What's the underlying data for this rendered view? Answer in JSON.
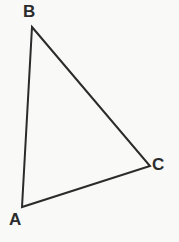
{
  "figure": {
    "kind": "geometry-diagram",
    "shape": "triangle",
    "background_color": "#f9f9f8",
    "stroke_color": "#2b2b2b",
    "stroke_width": 2,
    "label_color": "#2b2b2b"
  },
  "labels": {
    "a": "A",
    "b": "B",
    "c": "C"
  },
  "chart_data": {
    "type": "scatter",
    "title": "",
    "subtitle": "",
    "xlabel": "",
    "ylabel": "",
    "grid": false,
    "legend": "none",
    "xlim": [
      0,
      179
    ],
    "ylim": [
      242,
      0
    ],
    "annotations": [
      "A",
      "B",
      "C"
    ],
    "points": [
      {
        "label": "A",
        "x": 22,
        "y": 207
      },
      {
        "label": "B",
        "x": 32,
        "y": 27
      },
      {
        "label": "C",
        "x": 150,
        "y": 166
      }
    ],
    "edges": [
      {
        "from": "A",
        "to": "B"
      },
      {
        "from": "B",
        "to": "C"
      },
      {
        "from": "C",
        "to": "A"
      }
    ],
    "polygon_path": "M 32 27 L 150 166 L 22 207 Z"
  }
}
